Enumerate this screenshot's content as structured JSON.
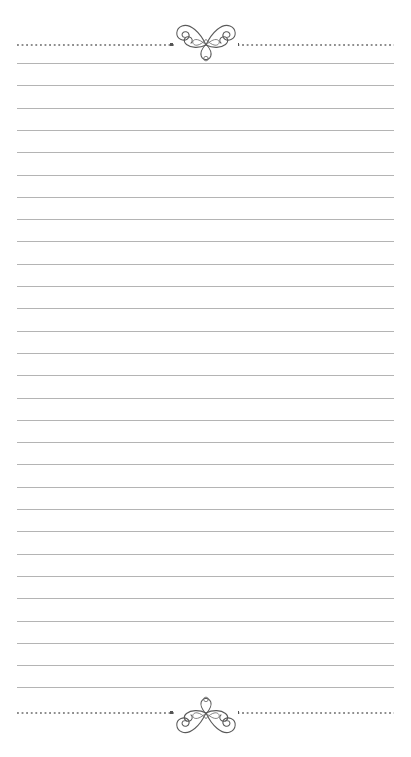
{
  "document": {
    "type": "ruled-stationery-page",
    "title": "Lined Notepaper with Decorative Flourishes",
    "background_color": "#ffffff",
    "width_px": 411,
    "height_px": 757
  },
  "colors": {
    "page_background": "#ffffff",
    "rule_line": "#b4b4b4",
    "dotted_rule": "#8e8e8e",
    "pip": "#555555",
    "ornament_stroke": "#5a5a5a"
  },
  "layout": {
    "content_left_px": 17,
    "content_right_px": 394,
    "content_width_px": 377,
    "line_spacing_px": 22.3
  },
  "header_rule": {
    "style": "dotted",
    "y_px": 45,
    "ornament_name": "butterfly-flourish",
    "ornament_orientation": "upright",
    "pip_left_x_px": 170,
    "pip_right_x_px": 236
  },
  "footer_rule": {
    "style": "dotted",
    "y_px": 713,
    "ornament_name": "butterfly-flourish",
    "ornament_orientation": "mirrored-vertical",
    "pip_left_x_px": 170,
    "pip_right_x_px": 236
  },
  "ruled_lines": {
    "count": 29,
    "first_y_px": 63,
    "spacing_px": 22.3,
    "y_positions": [
      63.0,
      85.3,
      107.6,
      129.9,
      152.2,
      174.5,
      196.8,
      219.1,
      241.4,
      263.7,
      286.0,
      308.3,
      330.6,
      352.9,
      375.2,
      397.5,
      419.8,
      442.1,
      464.4,
      486.7,
      509.0,
      531.3,
      553.6,
      575.9,
      598.2,
      620.5,
      642.8,
      665.1,
      687.4
    ]
  },
  "text_content": {
    "body_text": "",
    "note": "blank writing lines - no text present"
  }
}
